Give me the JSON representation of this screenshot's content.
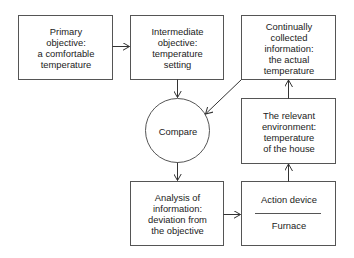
{
  "diagram": {
    "type": "flowchart",
    "nodes": [
      {
        "id": "primary",
        "shape": "rect",
        "text": "Primary\nobjective:\na comfortable\ntemperature"
      },
      {
        "id": "intermediate",
        "shape": "rect",
        "text": "Intermediate\nobjective:\ntemperature\nsetting"
      },
      {
        "id": "collected",
        "shape": "rect",
        "text": "Continually\ncollected\ninformation:\nthe actual\ntemperature"
      },
      {
        "id": "compare",
        "shape": "circle",
        "text": "Compare"
      },
      {
        "id": "environment",
        "shape": "rect",
        "text": "The relevant\nenvironment:\ntemperature\nof the house"
      },
      {
        "id": "analysis",
        "shape": "rect",
        "text": "Analysis of\ninformation:\ndeviation from\nthe objective"
      },
      {
        "id": "action",
        "shape": "rect-divided",
        "text_top": "Action device",
        "text_bottom": "Furnace"
      }
    ],
    "edges": [
      {
        "from": "primary",
        "to": "intermediate"
      },
      {
        "from": "intermediate",
        "to": "compare"
      },
      {
        "from": "collected",
        "to": "compare"
      },
      {
        "from": "compare",
        "to": "analysis"
      },
      {
        "from": "analysis",
        "to": "action"
      },
      {
        "from": "action",
        "to": "environment"
      },
      {
        "from": "environment",
        "to": "collected"
      }
    ],
    "colors": {
      "stroke": "#555555",
      "text": "#222222",
      "background": "#ffffff"
    }
  }
}
